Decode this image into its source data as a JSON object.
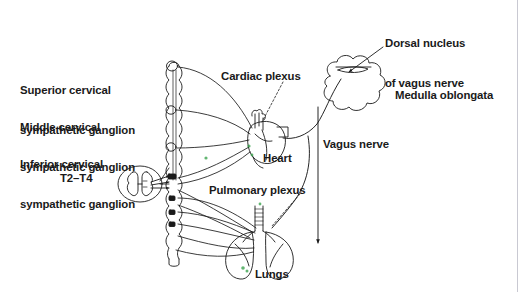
{
  "figure": {
    "background_color": "#ffffff",
    "line_color": "#1a1a1a",
    "text_color": "#1a1a1a",
    "accent_green": "#2f9e44",
    "border_color": "#c9c9d2"
  },
  "labels": {
    "superior_ganglion_line1": "Superior cervical",
    "superior_ganglion_line2": "sympathetic ganglion",
    "middle_ganglion_line1": "Middle cervical",
    "middle_ganglion_line2": "sympathetic ganglion",
    "inferior_ganglion_line1": "Inferior cervical",
    "inferior_ganglion_line2": "sympathetic ganglion",
    "spinal_segments": "T2–T4",
    "cardiac_plexus": "Cardiac plexus",
    "dorsal_nucleus_line1": "Dorsal nucleus",
    "dorsal_nucleus_line2": "of vagus nerve",
    "medulla_oblongata": "Medulla oblongata",
    "vagus_nerve": "Vagus nerve",
    "heart": "Heart",
    "pulmonary_plexus": "Pulmonary plexus",
    "lungs": "Lungs"
  },
  "structures": {
    "sympathetic_trunk": "sympathetic-chain",
    "spinal_cord": "spinal-cord-cross-section",
    "medulla": "medulla-oblongata-shape",
    "heart_organ": "heart-shape",
    "lungs_organ": "lungs-shape",
    "vagus_descending": "vagus-nerve-trunk"
  }
}
